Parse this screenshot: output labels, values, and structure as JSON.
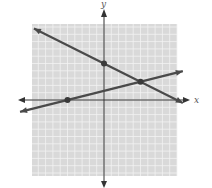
{
  "chart_data": {
    "type": "line",
    "title": "",
    "xlabel": "x",
    "ylabel": "y",
    "xlim": [
      -10,
      10
    ],
    "ylim": [
      -10,
      10
    ],
    "grid": true,
    "grid_step": 1,
    "series": [
      {
        "name": "line-1",
        "equation": "y = -0.5x + 5",
        "slope": -0.5,
        "intercept": 5,
        "x_range": [
          -9.6,
          10.8
        ]
      },
      {
        "name": "line-2",
        "equation": "y = 0.25x + 1.25",
        "slope": 0.25,
        "intercept": 1.25,
        "x_range": [
          -11.5,
          10.8
        ]
      }
    ],
    "points": [
      {
        "name": "y-intercept-line-1",
        "x": 0,
        "y": 5
      },
      {
        "name": "intersection",
        "x": 5,
        "y": 2.5
      },
      {
        "name": "x-intercept-line-2",
        "x": -5,
        "y": 0
      }
    ]
  },
  "colors": {
    "grid_background": "#d9d9d9",
    "grid_line": "#f2f2f2",
    "axis": "#333333",
    "line": "#4a4a4a",
    "point": "#3a3a3a"
  }
}
